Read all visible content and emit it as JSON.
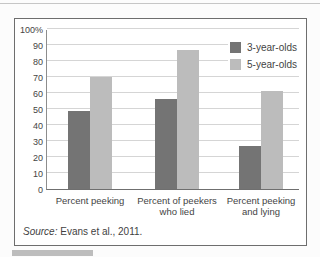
{
  "chart_data": {
    "type": "bar",
    "title": "",
    "categories": [
      "Percent peeking",
      "Percent of peekers\nwho lied",
      "Percent peeking\nand lying"
    ],
    "series": [
      {
        "name": "3-year-olds",
        "color": "#747474",
        "values": [
          49,
          56,
          27
        ]
      },
      {
        "name": "5-year-olds",
        "color": "#bcbcbc",
        "values": [
          70,
          87,
          61
        ]
      }
    ],
    "xlabel": "",
    "ylabel": "",
    "ylim": [
      0,
      100
    ],
    "y_tick_labels": [
      "100%",
      "90",
      "80",
      "70",
      "60",
      "50",
      "40",
      "30",
      "20",
      "10",
      "0"
    ],
    "grid": true,
    "legend_position": "top-right"
  },
  "source": {
    "prefix": "Source:",
    "text": " Evans et al., 2011."
  },
  "colors": {
    "grid": "#d5d5d5",
    "axis": "#8d8d8d",
    "frame_border": "#6e6e6e",
    "strip": "#bdbdbd"
  }
}
